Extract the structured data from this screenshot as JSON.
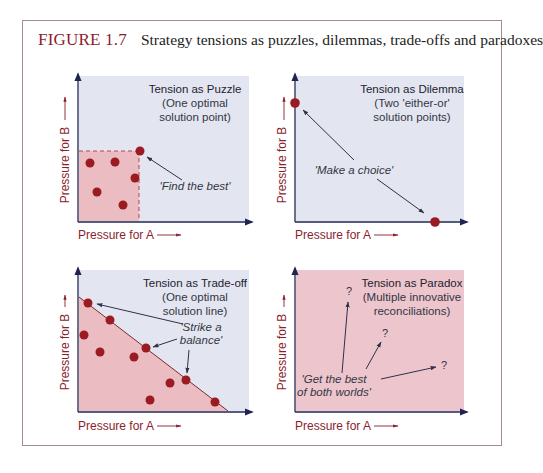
{
  "figure": {
    "number": "FIGURE 1.7",
    "caption": "Strategy tensions as puzzles, dilemmas, trade-offs and paradoxes"
  },
  "colors": {
    "frame_border": "#a88a8e",
    "figure_number": "#8a1e2e",
    "panel_blue": "#e3e6f0",
    "panel_pink": "#ecc6cc",
    "region_pink": "#ebbcc1",
    "dot": "#9a1b22",
    "axis": "#1f2550",
    "axis_label": "#8a1e2e"
  },
  "axes": {
    "x_label": "Pressure for A",
    "y_label": "Pressure for B"
  },
  "panels": [
    {
      "id": "puzzle",
      "title": "Tension as Puzzle",
      "subtitle_1": "(One optimal",
      "subtitle_2": "solution point)",
      "annotation": "'Find the best'"
    },
    {
      "id": "dilemma",
      "title": "Tension as Dilemma",
      "subtitle_1": "(Two 'either-or'",
      "subtitle_2": "solution points)",
      "annotation": "'Make a choice'"
    },
    {
      "id": "tradeoff",
      "title": "Tension as Trade-off",
      "subtitle_1": "(One optimal",
      "subtitle_2": "solution line)",
      "annotation_1": "'Strike a",
      "annotation_2": "balance'"
    },
    {
      "id": "paradox",
      "title": "Tension as Paradox",
      "subtitle_1": "(Multiple innovative",
      "subtitle_2": "reconciliations)",
      "annotation_1": "'Get the best",
      "annotation_2": "of both worlds'",
      "question_mark": "?"
    }
  ]
}
